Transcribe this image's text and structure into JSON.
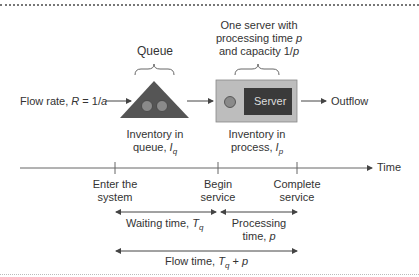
{
  "diagram": {
    "queue_label": "Queue",
    "server_desc": [
      "One server with",
      "processing time ",
      "p",
      "and capacity 1/",
      "p"
    ],
    "flow_rate": {
      "prefix": "Flow rate, ",
      "var": "R",
      "eq": " = 1/",
      "var2": "a"
    },
    "server_label": "Server",
    "outflow_label": "Outflow",
    "inventory_queue": {
      "line1": "Inventory in",
      "line2": "queue, ",
      "var": "I",
      "sub": "q"
    },
    "inventory_process": {
      "line1": "Inventory in",
      "line2": "process, ",
      "var": "I",
      "sub": "p"
    },
    "time_label": "Time",
    "events": [
      {
        "line1": "Enter the",
        "line2": "system"
      },
      {
        "line1": "Begin",
        "line2": "service"
      },
      {
        "line1": "Complete",
        "line2": "service"
      }
    ],
    "waiting_time": {
      "prefix": "Waiting time, ",
      "var": "T",
      "sub": "q"
    },
    "processing_time": {
      "line1": "Processing",
      "line2": "time, ",
      "var": "p"
    },
    "flow_time": {
      "prefix": "Flow time, ",
      "var": "T",
      "sub": "q",
      "suffix": " + ",
      "var2": "p"
    },
    "colors": {
      "triangle": "#555555",
      "circle": "#8a8a8a",
      "box": "#bdbdbd",
      "server": "#3a3a3a",
      "line": "#555555"
    }
  }
}
